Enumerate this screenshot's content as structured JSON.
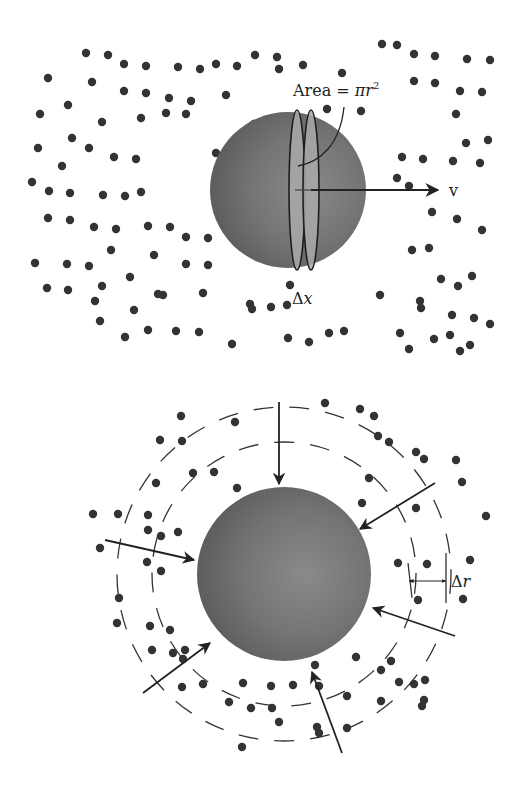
{
  "figure": {
    "top_panel": {
      "title": "Sphere moving through particle field",
      "area_label": "Area = ",
      "area_formula_pi": "π",
      "area_formula_r": "r",
      "area_formula_exp": "2",
      "velocity_label": "v",
      "thickness_label": "Δ",
      "thickness_var": "x",
      "sphere": {
        "cx": 288,
        "cy": 190,
        "r": 78
      },
      "disks": [
        {
          "cx": 297,
          "cy": 190,
          "rx": 8,
          "ry": 80
        },
        {
          "cx": 311,
          "cy": 190,
          "rx": 8,
          "ry": 80
        }
      ],
      "particles": [
        [
          86,
          53
        ],
        [
          108,
          55
        ],
        [
          124,
          64
        ],
        [
          146,
          66
        ],
        [
          178,
          67
        ],
        [
          200,
          69
        ],
        [
          216,
          64
        ],
        [
          237,
          66
        ],
        [
          255,
          55
        ],
        [
          277,
          57
        ],
        [
          303,
          65
        ],
        [
          382,
          44
        ],
        [
          397,
          45
        ],
        [
          414,
          54
        ],
        [
          435,
          56
        ],
        [
          467,
          59
        ],
        [
          490,
          60
        ],
        [
          48,
          78
        ],
        [
          92,
          82
        ],
        [
          124,
          91
        ],
        [
          146,
          93
        ],
        [
          169,
          98
        ],
        [
          191,
          101
        ],
        [
          226,
          95
        ],
        [
          279,
          69
        ],
        [
          342,
          73
        ],
        [
          414,
          81
        ],
        [
          435,
          83
        ],
        [
          460,
          91
        ],
        [
          482,
          92
        ],
        [
          40,
          114
        ],
        [
          68,
          105
        ],
        [
          102,
          122
        ],
        [
          141,
          118
        ],
        [
          254,
          124
        ],
        [
          327,
          109
        ],
        [
          361,
          111
        ],
        [
          456,
          114
        ],
        [
          466,
          143
        ],
        [
          488,
          140
        ],
        [
          38,
          148
        ],
        [
          72,
          138
        ],
        [
          89,
          148
        ],
        [
          166,
          113
        ],
        [
          186,
          114
        ],
        [
          216,
          153
        ],
        [
          402,
          157
        ],
        [
          423,
          159
        ],
        [
          453,
          161
        ],
        [
          480,
          163
        ],
        [
          62,
          166
        ],
        [
          114,
          157
        ],
        [
          136,
          159
        ],
        [
          397,
          178
        ],
        [
          409,
          186
        ],
        [
          432,
          212
        ],
        [
          457,
          219
        ],
        [
          482,
          230
        ],
        [
          32,
          182
        ],
        [
          49,
          191
        ],
        [
          70,
          193
        ],
        [
          103,
          195
        ],
        [
          125,
          196
        ],
        [
          141,
          192
        ],
        [
          290,
          285
        ],
        [
          412,
          250
        ],
        [
          429,
          248
        ],
        [
          441,
          279
        ],
        [
          458,
          286
        ],
        [
          472,
          276
        ],
        [
          48,
          218
        ],
        [
          70,
          220
        ],
        [
          94,
          227
        ],
        [
          116,
          229
        ],
        [
          148,
          226
        ],
        [
          170,
          227
        ],
        [
          186,
          237
        ],
        [
          208,
          238
        ],
        [
          420,
          301
        ],
        [
          452,
          315
        ],
        [
          474,
          318
        ],
        [
          111,
          250
        ],
        [
          154,
          255
        ],
        [
          186,
          264
        ],
        [
          208,
          265
        ],
        [
          380,
          295
        ],
        [
          421,
          308
        ],
        [
          450,
          335
        ],
        [
          470,
          345
        ],
        [
          35,
          263
        ],
        [
          67,
          264
        ],
        [
          89,
          266
        ],
        [
          130,
          277
        ],
        [
          158,
          294
        ],
        [
          203,
          293
        ],
        [
          434,
          339
        ],
        [
          490,
          324
        ],
        [
          47,
          288
        ],
        [
          68,
          290
        ],
        [
          102,
          286
        ],
        [
          95,
          301
        ],
        [
          100,
          321
        ],
        [
          134,
          310
        ],
        [
          163,
          295
        ],
        [
          250,
          304
        ],
        [
          271,
          307
        ],
        [
          287,
          305
        ],
        [
          125,
          337
        ],
        [
          148,
          330
        ],
        [
          176,
          331
        ],
        [
          199,
          332
        ],
        [
          232,
          344
        ],
        [
          252,
          309
        ],
        [
          288,
          338
        ],
        [
          309,
          342
        ],
        [
          329,
          333
        ],
        [
          344,
          331
        ],
        [
          400,
          333
        ],
        [
          409,
          349
        ],
        [
          460,
          351
        ]
      ],
      "arrow": {
        "x1": 297,
        "y1": 190,
        "x2": 438,
        "y2": 190
      }
    },
    "bottom_panel": {
      "title": "Diffusion to a sphere",
      "shell_label": "Δ",
      "shell_var": "r",
      "sphere": {
        "cx": 284,
        "cy": 574,
        "r": 87
      },
      "shells": [
        {
          "r": 132
        },
        {
          "r": 167
        }
      ],
      "arrows": [
        {
          "x1": 279,
          "y1": 402,
          "x2": 279,
          "y2": 484
        },
        {
          "x1": 435,
          "y1": 483,
          "x2": 360,
          "y2": 529
        },
        {
          "x1": 105,
          "y1": 540,
          "x2": 194,
          "y2": 560
        },
        {
          "x1": 455,
          "y1": 636,
          "x2": 373,
          "y2": 608
        },
        {
          "x1": 143,
          "y1": 693,
          "x2": 210,
          "y2": 643
        },
        {
          "x1": 342,
          "y1": 753,
          "x2": 312,
          "y2": 672
        }
      ],
      "delta_r_arrow": {
        "x1": 409,
        "y1": 581,
        "x2": 446,
        "y2": 581
      },
      "particles": [
        [
          181,
          416
        ],
        [
          235,
          422
        ],
        [
          325,
          403
        ],
        [
          360,
          409
        ],
        [
          374,
          416
        ],
        [
          378,
          436
        ],
        [
          389,
          442
        ],
        [
          160,
          440
        ],
        [
          182,
          441
        ],
        [
          416,
          452
        ],
        [
          424,
          459
        ],
        [
          456,
          460
        ],
        [
          462,
          482
        ],
        [
          193,
          473
        ],
        [
          214,
          472
        ],
        [
          237,
          488
        ],
        [
          369,
          478
        ],
        [
          362,
          503
        ],
        [
          416,
          508
        ],
        [
          486,
          516
        ],
        [
          156,
          483
        ],
        [
          118,
          514
        ],
        [
          93,
          514
        ],
        [
          148,
          515
        ],
        [
          148,
          530
        ],
        [
          178,
          532
        ],
        [
          161,
          536
        ],
        [
          100,
          548
        ],
        [
          147,
          562
        ],
        [
          161,
          571
        ],
        [
          398,
          563
        ],
        [
          427,
          564
        ],
        [
          470,
          560
        ],
        [
          119,
          598
        ],
        [
          117,
          623
        ],
        [
          150,
          626
        ],
        [
          170,
          630
        ],
        [
          185,
          650
        ],
        [
          152,
          650
        ],
        [
          173,
          653
        ],
        [
          183,
          659
        ],
        [
          182,
          687
        ],
        [
          203,
          684
        ],
        [
          243,
          683
        ],
        [
          271,
          686
        ],
        [
          293,
          685
        ],
        [
          229,
          702
        ],
        [
          251,
          708
        ],
        [
          272,
          708
        ],
        [
          279,
          722
        ],
        [
          315,
          665
        ],
        [
          356,
          657
        ],
        [
          391,
          661
        ],
        [
          381,
          670
        ],
        [
          425,
          680
        ],
        [
          414,
          684
        ],
        [
          319,
          686
        ],
        [
          347,
          696
        ],
        [
          381,
          701
        ],
        [
          424,
          700
        ],
        [
          422,
          706
        ],
        [
          418,
          600
        ],
        [
          463,
          599
        ],
        [
          242,
          747
        ],
        [
          317,
          727
        ],
        [
          319,
          733
        ],
        [
          347,
          728
        ],
        [
          399,
          682
        ]
      ]
    }
  }
}
